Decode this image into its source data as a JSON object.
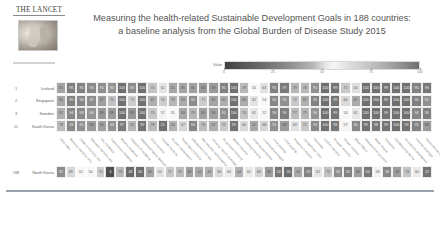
{
  "brand": {
    "wordmark": "THE LANCET",
    "cover_alt": "lancet-cover-image"
  },
  "title": {
    "line1": "Measuring the health-related Sustainable Development Goals in 188 countries:",
    "line2": "a baseline analysis from the Global Burden of Disease Study 2015"
  },
  "legend": {
    "label": "Value",
    "ticks": [
      "0",
      "25",
      "50",
      "75",
      "100"
    ],
    "tick_positions": [
      0,
      25,
      50,
      75,
      100
    ],
    "min_color": "#3f3f3f",
    "mid_color": "#f7f7f7",
    "max_color": "#707070"
  },
  "chart_data": {
    "type": "heatmap",
    "title": "Measuring the health-related Sustainable Development Goals in 188 countries: a baseline analysis from the Global Burden of Disease Study 2015",
    "xlabel": "",
    "ylabel": "",
    "legend_label": "Value",
    "zlim": [
      0,
      100
    ],
    "grid": true,
    "legend_position": "top",
    "row_rank_header": "Rank",
    "columns": [
      "SDG index",
      "Maternal mortality ratio",
      "Under-5 mortality rate",
      "Neonatal mortality rate",
      "HIV incidence",
      "Tuberculosis incidence",
      "Malaria incidence",
      "Hepatitis B incidence",
      "Neglected tropical diseases",
      "NCD mortality",
      "Suicide mortality",
      "Alcohol consumption",
      "Road injury mortality",
      "Adolescent birth rate",
      "Met need for contraception",
      "Universal health coverage",
      "Air pollution mortality",
      "WaSH mortality",
      "Poisoning mortality",
      "Smoking prevalence",
      "Childhood overweight",
      "Child stunting",
      "Child wasting",
      "Anaemia in women",
      "Occupational risks",
      "Homicide",
      "Conflict mortality",
      "Disaster mortality",
      "Sexual violence",
      "Mean PM2.5",
      "Household air pollution",
      "Water source",
      "Sanitation",
      "Handwashing facility",
      "Skilled birth attendance",
      "Vaccine coverage",
      "Health worker density"
    ],
    "rows": [
      {
        "rank": "1",
        "country": "Iceland",
        "values": [
          85,
          96,
          95,
          93,
          91,
          90,
          100,
          92,
          100,
          74,
          62,
          41,
          85,
          86,
          88,
          88,
          95,
          100,
          78,
          56,
          63,
          95,
          97,
          79,
          78,
          91,
          100,
          99,
          72,
          64,
          100,
          100,
          99,
          100,
          100,
          95,
          98
        ]
      },
      {
        "rank": "2",
        "country": "Singapore",
        "values": [
          84,
          95,
          94,
          92,
          87,
          75,
          100,
          71,
          100,
          81,
          70,
          79,
          83,
          92,
          71,
          85,
          82,
          100,
          83,
          62,
          54,
          94,
          91,
          72,
          81,
          95,
          100,
          99,
          66,
          42,
          100,
          100,
          99,
          100,
          100,
          96,
          91
        ]
      },
      {
        "rank": "3",
        "country": "Sweden",
        "values": [
          82,
          94,
          93,
          90,
          89,
          88,
          100,
          89,
          100,
          73,
          57,
          55,
          84,
          79,
          86,
          86,
          91,
          100,
          74,
          61,
          52,
          94,
          96,
          77,
          79,
          90,
          100,
          99,
          54,
          61,
          100,
          100,
          99,
          100,
          100,
          94,
          96
        ]
      },
      {
        "rank": "11",
        "country": "South Korea",
        "values": [
          78,
          93,
          91,
          88,
          86,
          34,
          97,
          45,
          99,
          78,
          21,
          44,
          67,
          94,
          76,
          82,
          72,
          99,
          66,
          41,
          68,
          91,
          88,
          63,
          72,
          93,
          100,
          98,
          57,
          30,
          99,
          98,
          99,
          100,
          99,
          95,
          88
        ]
      }
    ],
    "bottom_row": {
      "rank": "188",
      "country": "North Korea",
      "values": [
        32,
        49,
        52,
        56,
        70,
        6,
        78,
        18,
        20,
        40,
        50,
        72,
        76,
        86,
        42,
        44,
        66,
        60,
        44,
        60,
        68,
        38,
        24,
        20,
        41,
        29,
        62,
        75,
        33,
        28,
        38,
        24,
        58,
        30,
        38,
        74,
        60,
        22
      ]
    }
  }
}
